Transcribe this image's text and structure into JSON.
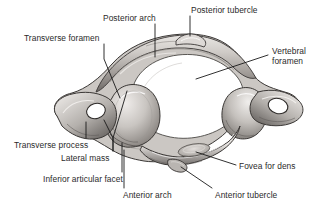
{
  "figure": {
    "background_color": "#ffffff",
    "text_color": "#2b2b2b",
    "leader_line_color": "#1a1a1a",
    "bone_light": "#f2f0ee",
    "bone_mid": "#b9b5b1",
    "bone_dark": "#6f6b68",
    "bone_outline": "#3a3735",
    "foramen_fill": "#ffffff"
  },
  "labels": [
    {
      "id": "transverse-foramen",
      "text": "Transverse foramen",
      "x": 24,
      "y": 34,
      "align": "left"
    },
    {
      "id": "posterior-arch",
      "text": "Posterior arch",
      "x": 103,
      "y": 14,
      "align": "left"
    },
    {
      "id": "posterior-tubercle",
      "text": "Posterior tubercle",
      "x": 191,
      "y": 6,
      "align": "left"
    },
    {
      "id": "vertebral-foramen",
      "text": "Vertebral",
      "x": 272,
      "y": 47,
      "align": "left"
    },
    {
      "id": "vertebral-foramen-2",
      "text": "foramen",
      "x": 272,
      "y": 57,
      "align": "left"
    },
    {
      "id": "transverse-process",
      "text": "Transverse process",
      "x": 14,
      "y": 141,
      "align": "left"
    },
    {
      "id": "lateral-mass",
      "text": "Lateral mass",
      "x": 61,
      "y": 154,
      "align": "left"
    },
    {
      "id": "inferior-articular-facet",
      "text": "Inferior articular facet",
      "x": 43,
      "y": 175,
      "align": "left"
    },
    {
      "id": "anterior-arch",
      "text": "Anterior arch",
      "x": 123,
      "y": 191,
      "align": "left"
    },
    {
      "id": "fovea-for-dens",
      "text": "Fovea for dens",
      "x": 239,
      "y": 162,
      "align": "left"
    },
    {
      "id": "anterior-tubercle",
      "text": "Anterior tubercle",
      "x": 215,
      "y": 191,
      "align": "left"
    }
  ],
  "leader_lines": [
    {
      "id": "leader-transverse-foramen",
      "points": "104,44 104,59 120,98"
    },
    {
      "id": "leader-posterior-arch",
      "points": "155,24 155,57"
    },
    {
      "id": "leader-posterior-tubercle",
      "points": "190,16 190,36"
    },
    {
      "id": "leader-vertebral-foramen",
      "points": "268,55 196,79"
    },
    {
      "id": "leader-transverse-process",
      "points": "86,138 86,122"
    },
    {
      "id": "leader-lateral-mass-a",
      "points": "113,151 113,138 104,120"
    },
    {
      "id": "leader-lateral-mass-b",
      "points": "113,151 113,138 127,91"
    },
    {
      "id": "leader-inferior-articular-facet",
      "points": "122,172 122,143"
    },
    {
      "id": "leader-anterior-arch",
      "points": "124,188 124,150"
    },
    {
      "id": "leader-fovea-for-dens",
      "points": "236,165 196,152"
    },
    {
      "id": "leader-anterior-tubercle",
      "points": "212,188 181,167"
    }
  ],
  "regions": [
    {
      "id": "posterior-arch-region",
      "description": "thick curved bony arch forming the posterior boundary"
    },
    {
      "id": "posterior-tubercle-region",
      "description": "small midline bump at the top of the posterior arch"
    },
    {
      "id": "vertebral-foramen-region",
      "description": "large central white opening"
    },
    {
      "id": "left-transverse-foramen-region",
      "description": "white oval hole in the left transverse process"
    },
    {
      "id": "right-transverse-foramen-region",
      "description": "white oval hole in the right transverse process"
    },
    {
      "id": "left-lateral-mass-region",
      "description": "large rounded bony mass on the left"
    },
    {
      "id": "right-lateral-mass-region",
      "description": "large rounded bony mass on the right"
    },
    {
      "id": "anterior-arch-region",
      "description": "slender arch forming the anterior boundary"
    },
    {
      "id": "anterior-tubercle-region",
      "description": "small bump on the anterior arch midline"
    },
    {
      "id": "fovea-for-dens-region",
      "description": "shallow oval articular facet on the inner anterior arch"
    },
    {
      "id": "left-transverse-process-region",
      "description": "lateral pointed projection on the left"
    },
    {
      "id": "right-transverse-process-region",
      "description": "lateral pointed projection on the right"
    }
  ]
}
